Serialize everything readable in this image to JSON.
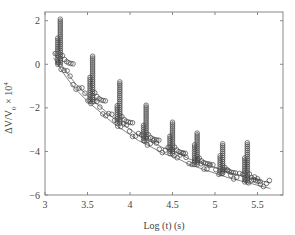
{
  "chart_data": {
    "type": "scatter",
    "title": "",
    "xlabel": "Log (t) (s)",
    "ylabel": "ΔV/V0 × 10^4",
    "xlim": [
      3.0,
      5.8
    ],
    "ylim": [
      -6,
      2.4
    ],
    "xticks": [
      3,
      3.5,
      4,
      4.5,
      5,
      5.5
    ],
    "yticks": [
      -6,
      -4,
      -2,
      0,
      2
    ],
    "grid": false,
    "legend": null,
    "marker": "open-circle",
    "line_color": "#666666",
    "series": [
      {
        "name": "baseline (lower envelope)",
        "x": [
          3.1,
          3.15,
          3.25,
          3.35,
          3.5,
          3.65,
          3.8,
          3.95,
          4.1,
          4.25,
          4.4,
          4.55,
          4.7,
          4.85,
          5.0,
          5.15,
          5.3,
          5.45,
          5.6,
          5.65
        ],
        "y": [
          0.3,
          0.0,
          -0.6,
          -1.1,
          -1.7,
          -2.2,
          -2.7,
          -3.1,
          -3.5,
          -3.8,
          -4.1,
          -4.3,
          -4.6,
          -4.8,
          -5.0,
          -5.2,
          -5.35,
          -5.5,
          -5.65,
          -5.7
        ]
      },
      {
        "name": "relaxation spikes",
        "x": [
          3.18,
          3.56,
          3.88,
          4.19,
          4.5,
          4.79,
          5.09,
          5.38
        ],
        "y_peak": [
          2.1,
          0.4,
          -0.8,
          -1.8,
          -2.6,
          -3.1,
          -3.6,
          -3.6
        ],
        "y_shoulder": [
          1.2,
          -0.5,
          -1.8,
          -2.7,
          -3.2,
          -3.7,
          -4.2,
          -4.3
        ],
        "y_base": [
          0.0,
          -1.7,
          -2.7,
          -3.5,
          -4.1,
          -4.6,
          -5.0,
          -5.4
        ]
      }
    ]
  }
}
